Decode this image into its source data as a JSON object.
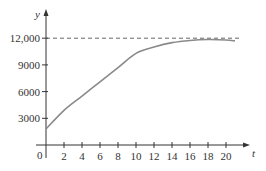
{
  "chart_data": {
    "type": "line",
    "title": "",
    "xlabel": "t",
    "ylabel": "y",
    "xlim": [
      0,
      22
    ],
    "ylim": [
      0,
      13500
    ],
    "x_ticks": [
      2,
      4,
      6,
      8,
      10,
      12,
      14,
      16,
      18,
      20
    ],
    "x_tick_labels": [
      "2",
      "4",
      "6",
      "8",
      "10",
      "12",
      "14",
      "16",
      "18",
      "20"
    ],
    "y_ticks": [
      3000,
      6000,
      9000,
      12000
    ],
    "y_tick_labels": [
      "3000",
      "6000",
      "9000",
      "12,000"
    ],
    "origin_label": "0",
    "grid": false,
    "legend": null,
    "series": [
      {
        "name": "y(t)",
        "style": "solid",
        "x": [
          0,
          2,
          4,
          6,
          8,
          10,
          12,
          14,
          16,
          18,
          20,
          21
        ],
        "values": [
          1800,
          3900,
          5500,
          7100,
          8700,
          10300,
          11000,
          11500,
          11750,
          11850,
          11800,
          11700
        ]
      }
    ],
    "reference_lines": [
      {
        "type": "horizontal",
        "style": "dashed",
        "y": 12000,
        "x_range": [
          0,
          22
        ]
      }
    ]
  },
  "colors": {
    "axis": "#333333",
    "curve": "#8a8a8a",
    "dashed": "#555555"
  }
}
